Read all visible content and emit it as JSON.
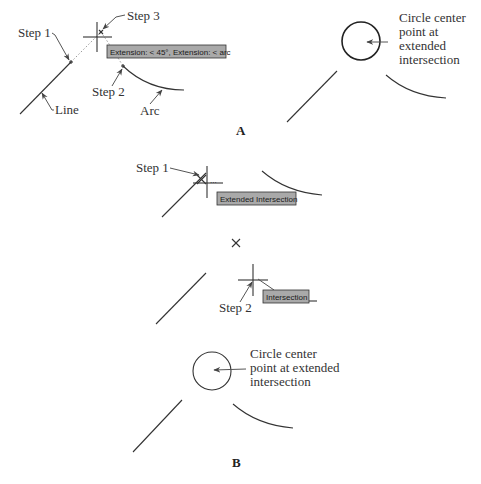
{
  "top_cropped_text": "...erpoint of two lines, or intersect at their extended intersection",
  "panel_a": {
    "label": "A",
    "callouts": {
      "step1": "Step 1",
      "step2": "Step 2",
      "step3": "Step 3",
      "line": "Line",
      "arc": "Arc"
    },
    "tooltip": "Extension: < 45°,  Extension: < arc",
    "result_note": [
      "Circle center",
      "point at",
      "extended",
      "intersection"
    ]
  },
  "panel_b": {
    "label": "B",
    "callouts": {
      "step1": "Step 1",
      "step2": "Step 2"
    },
    "tooltip_1": "Extended Intersection",
    "tooltip_2": "Intersection",
    "result_note": [
      "Circle center",
      "point at extended",
      "intersection"
    ]
  },
  "colors": {
    "ink": "#333333",
    "tooltip_fill": "#a9a9a9",
    "dotted_extension": "#999999"
  }
}
